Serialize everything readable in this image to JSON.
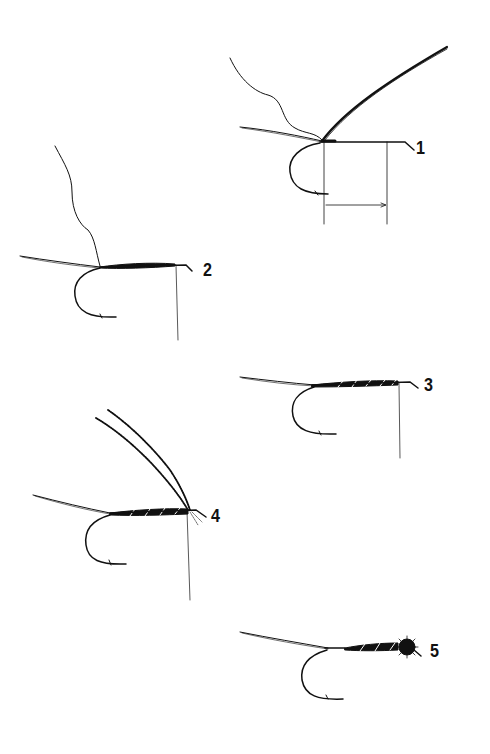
{
  "diagram": {
    "ink_color": "#111111",
    "background": "#ffffff",
    "steps": [
      {
        "number": "1",
        "description": "Tie in thread and body material; measure shank length"
      },
      {
        "number": "2",
        "description": "Wrap thread to form underbody"
      },
      {
        "number": "3",
        "description": "Rib the body"
      },
      {
        "number": "4",
        "description": "Add hackle fibers"
      },
      {
        "number": "5",
        "description": "Finish with head"
      }
    ]
  }
}
